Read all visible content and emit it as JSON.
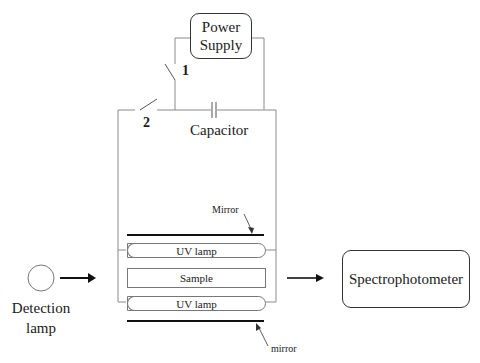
{
  "diagram": {
    "power_supply": {
      "line1": "Power",
      "line2": "Supply"
    },
    "switch_1": {
      "label": "1"
    },
    "switch_2": {
      "label": "2"
    },
    "capacitor": {
      "label": "Capacitor"
    },
    "mirror_top": {
      "label": "Mirror"
    },
    "uv_lamp_top": {
      "label": "UV lamp"
    },
    "sample": {
      "label": "Sample"
    },
    "uv_lamp_bottom": {
      "label": "UV lamp"
    },
    "mirror_bottom": {
      "label": "mirror"
    },
    "detection_lamp": {
      "line1": "Detection",
      "line2": "lamp"
    },
    "spectrophotometer": {
      "label": "Spectrophotometer"
    }
  },
  "colors": {
    "wire": "#8a8a8a",
    "stroke": "#1a1a1a",
    "mirror": "#111111"
  }
}
